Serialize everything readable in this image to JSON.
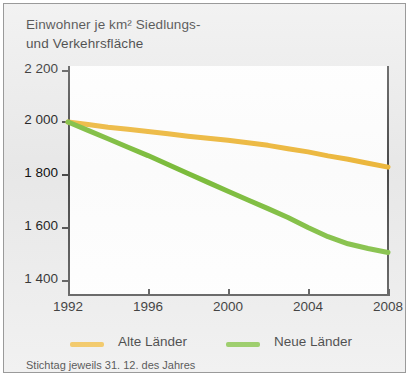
{
  "figure": {
    "title": "Einwohner je km² Siedlungs-\nund Verkehrsfläche",
    "footnote": "Stichtag jeweils 31. 12. des Jahres",
    "background_color": "#ebebeb",
    "plot_background_color": "#ffffff",
    "border_color": "#9a9a9a",
    "axis_color": "#4a4a4a"
  },
  "legend": {
    "position": "bottom",
    "items": [
      {
        "label": "Alte Länder",
        "color": "#efb93c"
      },
      {
        "label": "Neue Länder",
        "color": "#7dbe3c"
      }
    ]
  },
  "axes": {
    "y_ticks": [
      "2 200",
      "2 000",
      "1 800",
      "1 600",
      "1 400"
    ],
    "x_ticks": [
      "1992",
      "1996",
      "2000",
      "2004",
      "2008"
    ]
  },
  "chart_data": {
    "type": "line",
    "title": "Einwohner je km² Siedlungs- und Verkehrsfläche",
    "subtitle": "",
    "xlabel": "",
    "ylabel": "",
    "annotations": [
      "Stichtag jeweils 31. 12. des Jahres"
    ],
    "grid": false,
    "legend_position": "bottom",
    "xlim": [
      1992,
      2008
    ],
    "ylim": [
      1400,
      2200
    ],
    "x": [
      1992,
      1993,
      1994,
      1995,
      1996,
      1997,
      1998,
      1999,
      2000,
      2001,
      2002,
      2003,
      2004,
      2005,
      2006,
      2007,
      2008
    ],
    "xtick_labels": [
      "1992",
      "1996",
      "2000",
      "2004",
      "2008"
    ],
    "xtick_values": [
      1992,
      1996,
      2000,
      2004,
      2008
    ],
    "ytick_labels": [
      "2 200",
      "2 000",
      "1 800",
      "1 600",
      "1 400"
    ],
    "ytick_values": [
      2200,
      2000,
      1800,
      1600,
      1400
    ],
    "series": [
      {
        "name": "Alte Länder",
        "color": "#efb93c",
        "values": [
          2002,
          1992,
          1982,
          1974,
          1966,
          1957,
          1948,
          1940,
          1932,
          1923,
          1913,
          1900,
          1888,
          1873,
          1860,
          1845,
          1830
        ]
      },
      {
        "name": "Neue Länder",
        "color": "#7dbe3c",
        "values": [
          2002,
          1970,
          1938,
          1906,
          1874,
          1840,
          1806,
          1772,
          1738,
          1705,
          1672,
          1638,
          1600,
          1565,
          1538,
          1520,
          1505
        ]
      }
    ]
  }
}
